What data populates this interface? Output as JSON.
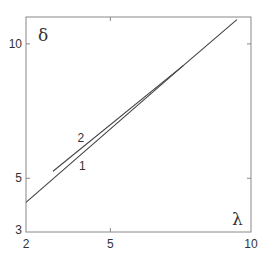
{
  "chart_data": {
    "type": "line",
    "title": "",
    "xlabel": "λ",
    "ylabel": "δ",
    "xlim": [
      2,
      10
    ],
    "ylim": [
      3,
      11
    ],
    "x_ticks": [
      2,
      5,
      10
    ],
    "y_ticks": [
      3,
      5,
      10
    ],
    "x_tick_labels": [
      "2",
      "5",
      "10"
    ],
    "y_tick_labels": [
      "3",
      "5",
      "10"
    ],
    "grid": false,
    "legend": null,
    "series": [
      {
        "name": "1",
        "x": [
          2.0,
          7.6,
          9.5
        ],
        "y": [
          4.1,
          9.2,
          10.9
        ]
      },
      {
        "name": "2",
        "x": [
          2.96,
          7.6
        ],
        "y": [
          5.26,
          9.2
        ]
      }
    ],
    "annotations": [
      {
        "text": "1",
        "x": 4.0,
        "y": 5.3
      },
      {
        "text": "2",
        "x": 3.95,
        "y": 6.35
      }
    ],
    "colors": {
      "axis": "#888888",
      "line": "#444444",
      "text": "#333333"
    }
  }
}
